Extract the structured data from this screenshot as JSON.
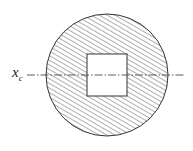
{
  "diagram": {
    "axis_label": "x",
    "axis_subscript": "c",
    "shapes": {
      "outer": "circle (hatched)",
      "hole": "square (unhatched)",
      "axis": "horizontal dash-dot centroidal axis"
    }
  }
}
